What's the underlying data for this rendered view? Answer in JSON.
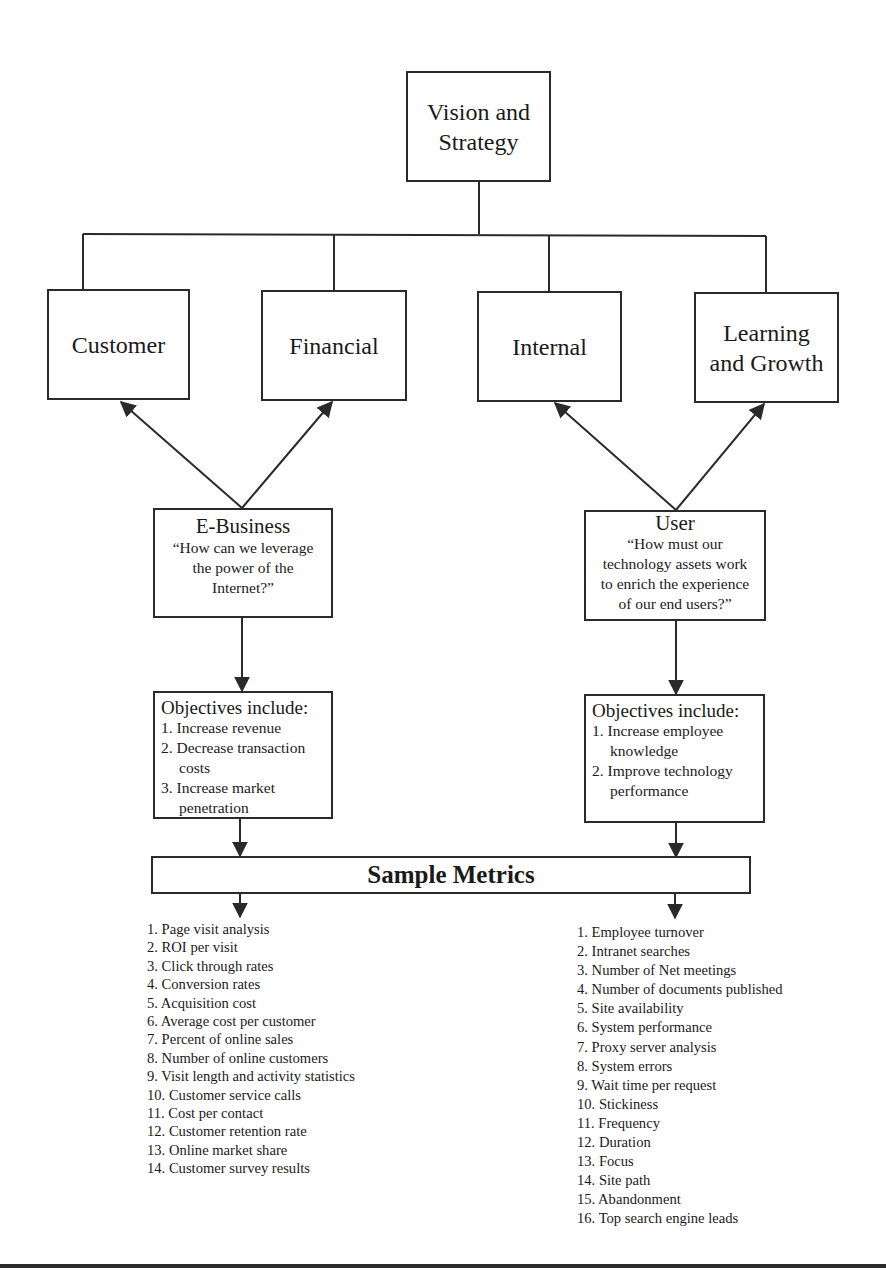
{
  "diagram": {
    "root": {
      "label_line1": "Vision and",
      "label_line2": "Strategy"
    },
    "perspectives": [
      {
        "label_line1": "Customer",
        "label_line2": ""
      },
      {
        "label_line1": "Financial",
        "label_line2": ""
      },
      {
        "label_line1": "Internal",
        "label_line2": ""
      },
      {
        "label_line1": "Learning",
        "label_line2": "and Growth"
      }
    ],
    "ebusiness": {
      "title": "E-Business",
      "question_lines": [
        "“How can we leverage",
        "the power of the",
        "Internet?”"
      ]
    },
    "user": {
      "title": "User",
      "question_lines": [
        "“How must our",
        "technology assets work",
        "to enrich the experience",
        "of our end users?”"
      ]
    },
    "ebusiness_objectives": {
      "heading": "Objectives include:",
      "items": [
        "1. Increase revenue",
        "2. Decrease transaction costs",
        "3. Increase market penetration"
      ]
    },
    "user_objectives": {
      "heading": "Objectives include:",
      "items": [
        "1. Increase employee knowledge",
        "2. Improve technology performance"
      ]
    },
    "sample_metrics": {
      "title": "Sample Metrics"
    },
    "ebusiness_metrics": [
      "1. Page visit analysis",
      "2. ROI per visit",
      "3. Click through rates",
      "4. Conversion rates",
      "5. Acquisition cost",
      "6. Average cost per customer",
      "7. Percent of online sales",
      "8. Number of online customers",
      "9. Visit length and activity statistics",
      "10. Customer service calls",
      "11. Cost per contact",
      "12. Customer retention rate",
      "13. Online market share",
      "14. Customer survey results"
    ],
    "user_metrics": [
      "1. Employee turnover",
      "2. Intranet searches",
      "3. Number of Net meetings",
      "4. Number of documents published",
      "5. Site availability",
      "6. System performance",
      "7. Proxy server analysis",
      "8. System errors",
      "9. Wait time per request",
      "10. Stickiness",
      "11. Frequency",
      "12. Duration",
      "13. Focus",
      "14. Site path",
      "15. Abandonment",
      "16. Top search engine leads"
    ]
  },
  "colors": {
    "line": "#2a2a2a",
    "background": "#ffffff",
    "text": "#1a1a1a"
  }
}
